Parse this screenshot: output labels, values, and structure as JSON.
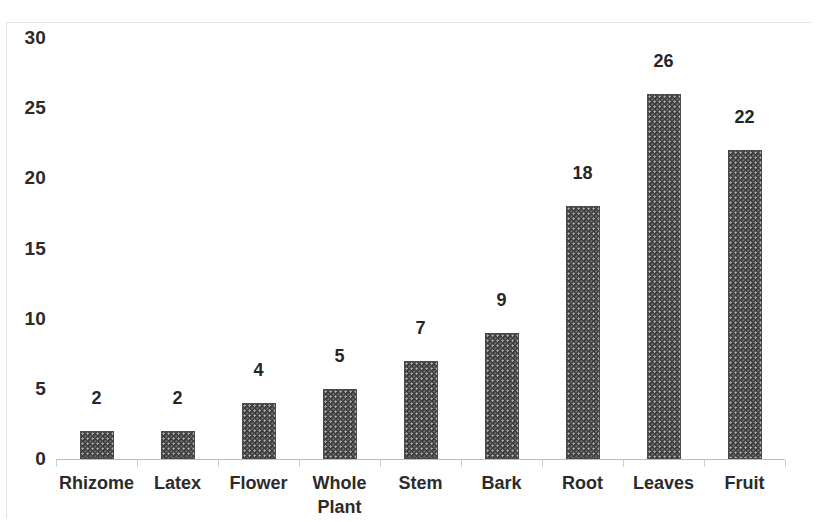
{
  "chart_data": {
    "type": "bar",
    "title": "",
    "subtitle": "",
    "xlabel": "",
    "ylabel": "",
    "categories": [
      "Rhizome",
      "Latex",
      "Flower",
      "Whole\nPlant",
      "Stem",
      "Bark",
      "Root",
      "Leaves",
      "Fruit"
    ],
    "values": [
      2,
      2,
      4,
      5,
      7,
      9,
      18,
      26,
      22
    ],
    "data_labels": [
      "2",
      "2",
      "4",
      "5",
      "7",
      "9",
      "18",
      "26",
      "22"
    ],
    "ylim": [
      0,
      30
    ],
    "y_ticks": [
      0,
      5,
      10,
      15,
      20,
      25,
      30
    ],
    "y_tick_labels": [
      "0",
      "5",
      "10",
      "15",
      "20",
      "25",
      "30"
    ],
    "grid": false,
    "legend": "none",
    "series": [
      {
        "name": "Number of species",
        "values": [
          2,
          2,
          4,
          5,
          7,
          9,
          18,
          26,
          22
        ]
      }
    ]
  },
  "style": {
    "bar_fill": "#3d3d3d",
    "bar_pattern": "dotted-texture",
    "axis_color": "#bdbdbd",
    "text_color": "#2b2b2b",
    "background": "#ffffff"
  }
}
